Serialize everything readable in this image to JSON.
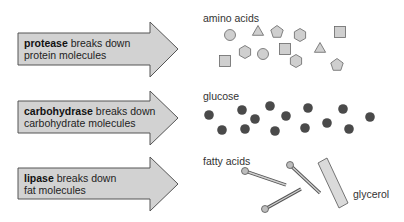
{
  "rows": [
    {
      "enzyme": "protease",
      "line1_rest": " breaks down",
      "line2": "protein molecules",
      "product_label": "amino acids"
    },
    {
      "enzyme": "carbohydrase",
      "line1_rest": " breaks down",
      "line2": "carbohydrate molecules",
      "product_label": "glucose"
    },
    {
      "enzyme": "lipase",
      "line1_rest": " breaks down",
      "line2": "fat molecules",
      "product_label": "fatty acids",
      "extra_label": "glycerol"
    }
  ],
  "colors": {
    "arrow_fill": "#d2d2d2",
    "arrow_stroke": "#555555",
    "amino_fill": "#cfcfcf",
    "glucose_fill": "#4a4a4a"
  },
  "amino_acids": [
    {
      "shape": "circle",
      "x": 230,
      "y": 35
    },
    {
      "shape": "triangle",
      "x": 258,
      "y": 31
    },
    {
      "shape": "pentagon",
      "x": 277,
      "y": 32
    },
    {
      "shape": "hexagon",
      "x": 300,
      "y": 35
    },
    {
      "shape": "square",
      "x": 340,
      "y": 32
    },
    {
      "shape": "hexagon",
      "x": 245,
      "y": 52
    },
    {
      "shape": "circle",
      "x": 263,
      "y": 54
    },
    {
      "shape": "square",
      "x": 285,
      "y": 49
    },
    {
      "shape": "triangle",
      "x": 320,
      "y": 48
    },
    {
      "shape": "square",
      "x": 225,
      "y": 61
    },
    {
      "shape": "hexagon",
      "x": 296,
      "y": 61
    },
    {
      "shape": "pentagon",
      "x": 337,
      "y": 65
    }
  ],
  "glucose_molecules": [
    {
      "x": 209,
      "y": 115
    },
    {
      "x": 222,
      "y": 130
    },
    {
      "x": 242,
      "y": 110
    },
    {
      "x": 245,
      "y": 129
    },
    {
      "x": 255,
      "y": 119
    },
    {
      "x": 270,
      "y": 106
    },
    {
      "x": 286,
      "y": 116
    },
    {
      "x": 275,
      "y": 131
    },
    {
      "x": 308,
      "y": 108
    },
    {
      "x": 305,
      "y": 128
    },
    {
      "x": 327,
      "y": 123
    },
    {
      "x": 343,
      "y": 109
    },
    {
      "x": 349,
      "y": 129
    },
    {
      "x": 370,
      "y": 117
    }
  ],
  "fatty_acids": [
    {
      "hx": 245,
      "hy": 171,
      "ex": 286,
      "ey": 185
    },
    {
      "hx": 290,
      "hy": 165,
      "ex": 320,
      "ey": 193
    },
    {
      "hx": 265,
      "hy": 209,
      "ex": 301,
      "ey": 189
    }
  ]
}
